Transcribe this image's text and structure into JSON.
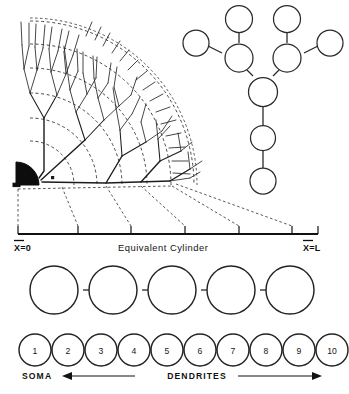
{
  "figure": {
    "panels": [
      {
        "id": "dendritic-tree",
        "name": "branching-dendritic-tree",
        "description": "Fan-shaped branching dendritic tree with soma at origin and dashed electrotonic arcs"
      },
      {
        "id": "compartment-tree",
        "name": "branched-compartment-tree",
        "description": "Ten-compartment branched tree of open circles"
      },
      {
        "id": "equivalent-cylinder-chain",
        "name": "equivalent-cylinder-chain",
        "description": "Chain of five equal open circles"
      },
      {
        "id": "numbered-compartments",
        "name": "numbered-compartment-chain",
        "description": "Chain of ten numbered open circles"
      }
    ]
  },
  "axis": {
    "left_label": "X=0",
    "left_symbol": "X",
    "left_value": "0",
    "right_label": "X=L",
    "right_symbol": "X",
    "right_value": "L",
    "center_label": "Equivalent Cylinder",
    "tick_count": 6,
    "tick_positions": [
      18,
      78,
      131,
      185,
      239,
      292
    ]
  },
  "compartments": {
    "labels": [
      "1",
      "2",
      "3",
      "4",
      "5",
      "6",
      "7",
      "8",
      "9",
      "10"
    ],
    "count": 10
  },
  "cylinder_chain": {
    "segment_count": 5
  },
  "tree": {
    "node_count": 10,
    "terminal_count": 4,
    "branch_count": 2,
    "stem_count": 3
  },
  "annotations": {
    "soma_label": "SOMA",
    "dendrites_label": "DENDRITES"
  },
  "colors": {
    "ink": "#1c1c1c",
    "soma_fill": "#0d0d0d",
    "dash": "#333333",
    "background": "#ffffff"
  }
}
